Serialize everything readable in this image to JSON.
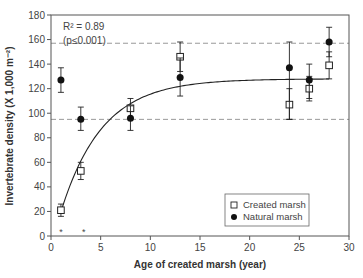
{
  "chart_data": {
    "type": "scatter",
    "title": "",
    "xlabel": "Age of created marsh (year)",
    "ylabel": "Invertebrate density (X 1,000 m⁻²)",
    "xlim": [
      0,
      30
    ],
    "ylim": [
      0,
      180
    ],
    "xticks": [
      0,
      5,
      10,
      15,
      20,
      25,
      30
    ],
    "yticks": [
      0,
      20,
      40,
      60,
      80,
      100,
      120,
      140,
      160,
      180
    ],
    "grid": false,
    "legend_position": "lower right",
    "annotation": {
      "line1": "R² = 0.89",
      "line2": "(p≤0.001)"
    },
    "reference_lines": [
      {
        "style": "dashed",
        "y": 157
      },
      {
        "style": "dashed",
        "y": 95
      }
    ],
    "significance_markers": [
      {
        "x": 1,
        "label": "*"
      },
      {
        "x": 3.3,
        "label": "*"
      }
    ],
    "fit_curve": {
      "type": "exponential rise to max",
      "formula": "y = 128*(1-exp(-0.24*(x-0.3)))",
      "x_range": [
        1,
        28
      ]
    },
    "series": [
      {
        "name": "Created marsh",
        "marker": "open-square",
        "points": [
          {
            "x": 1,
            "y": 21,
            "err_low": 16,
            "err_high": 26
          },
          {
            "x": 3,
            "y": 53,
            "err_low": 46,
            "err_high": 60
          },
          {
            "x": 8,
            "y": 104,
            "err_low": 96,
            "err_high": 112
          },
          {
            "x": 13,
            "y": 146,
            "err_low": 134,
            "err_high": 158
          },
          {
            "x": 24,
            "y": 107,
            "err_low": 95,
            "err_high": 120
          },
          {
            "x": 26,
            "y": 120,
            "err_low": 110,
            "err_high": 130
          },
          {
            "x": 28,
            "y": 139,
            "err_low": 128,
            "err_high": 150
          }
        ]
      },
      {
        "name": "Natural marsh",
        "marker": "filled-circle",
        "points": [
          {
            "x": 1,
            "y": 127,
            "err_low": 117,
            "err_high": 137
          },
          {
            "x": 3,
            "y": 95,
            "err_low": 86,
            "err_high": 105
          },
          {
            "x": 8,
            "y": 96,
            "err_low": 86,
            "err_high": 106
          },
          {
            "x": 13,
            "y": 129,
            "err_low": 114,
            "err_high": 145
          },
          {
            "x": 24,
            "y": 137,
            "err_low": 95,
            "err_high": 158
          },
          {
            "x": 26,
            "y": 127,
            "err_low": 112,
            "err_high": 140
          },
          {
            "x": 28,
            "y": 158,
            "err_low": 146,
            "err_high": 170
          }
        ]
      }
    ]
  },
  "legend": {
    "items": [
      {
        "label": "Created marsh",
        "marker": "open-square"
      },
      {
        "label": "Natural marsh",
        "marker": "filled-circle"
      }
    ]
  },
  "colors": {
    "axis": "#555555",
    "marker": "#111111",
    "dashed": "#999999",
    "text": "#444444"
  }
}
